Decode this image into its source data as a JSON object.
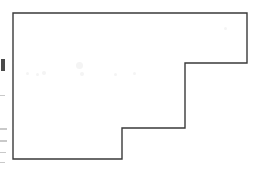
{
  "figure": {
    "title": "Rectilinear staircase polygon outline",
    "caption": "",
    "background_color": "#ffffff",
    "stroke_color": "#3a3a3a",
    "stroke_width": 1.4,
    "fill_color": "#ffffff",
    "width": 254,
    "height": 174
  },
  "chart_data": {
    "type": "line",
    "title": "Rectilinear staircase polygon outline",
    "subtitle": "",
    "xlabel": "",
    "ylabel": "",
    "xlim": [
      0,
      254
    ],
    "ylim": [
      0,
      174
    ],
    "grid": false,
    "legend": "none",
    "annotations": [],
    "series": [
      {
        "name": "polygon-outline",
        "closed": true,
        "stroke": "#3a3a3a",
        "fill": "none",
        "points": [
          [
            13,
            13
          ],
          [
            247,
            13
          ],
          [
            247,
            63
          ],
          [
            185,
            63
          ],
          [
            185,
            128
          ],
          [
            122,
            128
          ],
          [
            122,
            159
          ],
          [
            13,
            159
          ]
        ]
      }
    ],
    "edges": [
      {
        "name": "top-edge",
        "from": [
          13,
          13
        ],
        "to": [
          247,
          13
        ],
        "orientation": "horizontal"
      },
      {
        "name": "right-edge-upper",
        "from": [
          247,
          13
        ],
        "to": [
          247,
          63
        ],
        "orientation": "vertical"
      },
      {
        "name": "step-top-tread",
        "from": [
          247,
          63
        ],
        "to": [
          185,
          63
        ],
        "orientation": "horizontal"
      },
      {
        "name": "step-upper-riser",
        "from": [
          185,
          63
        ],
        "to": [
          185,
          128
        ],
        "orientation": "vertical"
      },
      {
        "name": "step-lower-tread",
        "from": [
          185,
          128
        ],
        "to": [
          122,
          128
        ],
        "orientation": "horizontal"
      },
      {
        "name": "step-lower-riser",
        "from": [
          122,
          128
        ],
        "to": [
          122,
          159
        ],
        "orientation": "vertical"
      },
      {
        "name": "bottom-edge",
        "from": [
          122,
          159
        ],
        "to": [
          13,
          159
        ],
        "orientation": "horizontal"
      },
      {
        "name": "left-edge",
        "from": [
          13,
          159
        ],
        "to": [
          13,
          13
        ],
        "orientation": "vertical"
      }
    ]
  },
  "margin_marks": [
    {
      "name": "left-margin-mark-1",
      "x": 1,
      "y": 59,
      "width": 4,
      "height": 12,
      "strong": true
    },
    {
      "name": "left-margin-mark-2",
      "x": 0,
      "y": 95,
      "width": 5,
      "height": 1,
      "strong": false
    },
    {
      "name": "left-margin-mark-3",
      "x": 0,
      "y": 128,
      "width": 7,
      "height": 2,
      "strong": false
    },
    {
      "name": "left-margin-mark-4",
      "x": 0,
      "y": 140,
      "width": 7,
      "height": 2,
      "strong": false
    },
    {
      "name": "left-margin-mark-5",
      "x": 0,
      "y": 152,
      "width": 6,
      "height": 1,
      "strong": false
    },
    {
      "name": "left-margin-mark-6",
      "x": 0,
      "y": 162,
      "width": 5,
      "height": 1,
      "strong": false
    }
  ],
  "ghost_marks": [
    {
      "name": "ghost-mark-1",
      "x": 26,
      "y": 72,
      "size": 3
    },
    {
      "name": "ghost-mark-2",
      "x": 36,
      "y": 73,
      "size": 3
    },
    {
      "name": "ghost-mark-3",
      "x": 42,
      "y": 71,
      "size": 4
    },
    {
      "name": "ghost-mark-4",
      "x": 76,
      "y": 62,
      "size": 7
    },
    {
      "name": "ghost-mark-5",
      "x": 80,
      "y": 72,
      "size": 4
    },
    {
      "name": "ghost-mark-6",
      "x": 114,
      "y": 73,
      "size": 3
    },
    {
      "name": "ghost-mark-7",
      "x": 133,
      "y": 72,
      "size": 3
    },
    {
      "name": "ghost-mark-8",
      "x": 224,
      "y": 27,
      "size": 3
    }
  ]
}
